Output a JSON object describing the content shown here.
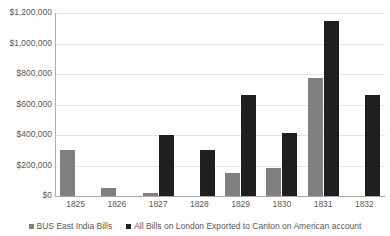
{
  "chart_data": {
    "type": "bar",
    "title": "",
    "subtitle": "",
    "xlabel": "",
    "ylabel": "",
    "categories": [
      "1825",
      "1826",
      "1827",
      "1828",
      "1829",
      "1830",
      "1831",
      "1832"
    ],
    "series": [
      {
        "name": "BUS East India Bills",
        "color": "#808080",
        "values": [
          300000,
          50000,
          20000,
          0,
          150000,
          185000,
          775000,
          0
        ]
      },
      {
        "name": "All Bills on London Exported to Canton on American account",
        "color": "#1f1f1f",
        "values": [
          0,
          0,
          400000,
          300000,
          660000,
          415000,
          1150000,
          660000
        ]
      }
    ],
    "ylim": [
      0,
      1200000
    ],
    "ytick_values": [
      1200000,
      1000000,
      800000,
      600000,
      400000,
      200000,
      0
    ],
    "ytick_labels": [
      "$1,200,000",
      "$1,000,000",
      "$800,000",
      "$600,000",
      "$400,000",
      "$200,000",
      "$0"
    ],
    "grid": true,
    "grid_axis": "y",
    "legend_position": "bottom"
  }
}
